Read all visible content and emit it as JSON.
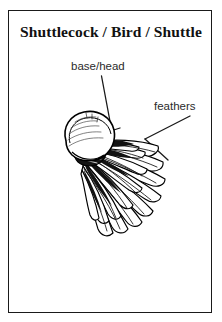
{
  "panel": {
    "title": "Shuttlecock / Bird / Shuttle",
    "border_color": "#1a1a1a",
    "background_color": "#ffffff"
  },
  "annotations": [
    {
      "id": "base-head",
      "label": "base/head"
    },
    {
      "id": "feathers",
      "label": "feathers"
    }
  ],
  "labels": {
    "base_head": "base/head",
    "feathers": "feathers"
  },
  "illustration": {
    "name": "shuttlecock-illustration",
    "subject": "badminton shuttlecock",
    "style": "black and white line drawing",
    "orientation": "diagonal, cork base upper-left, feather skirt lower-right",
    "ink_color": "#000000",
    "parts": [
      "cork base",
      "feather skirt",
      "binding band"
    ],
    "feather_count": 16
  },
  "leaders": {
    "base_head_line": "from label down-right to cork base",
    "feathers_line": "from label down-left to feather skirt"
  }
}
